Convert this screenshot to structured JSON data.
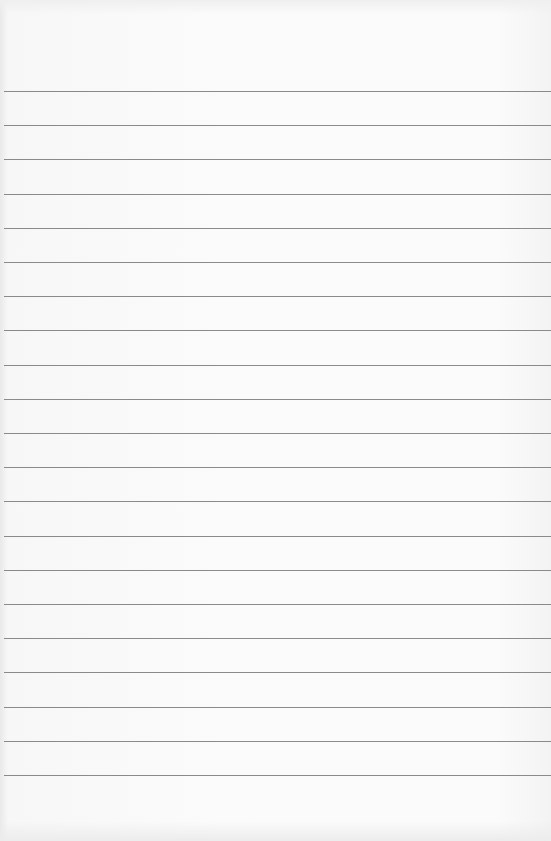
{
  "page": {
    "type": "lined-notebook-paper",
    "paper_color": "#fbfbfb",
    "rule_color": "#8a8a8a",
    "rule_count": 21,
    "first_rule_y": 91,
    "rule_spacing": 34.2,
    "text": ""
  }
}
